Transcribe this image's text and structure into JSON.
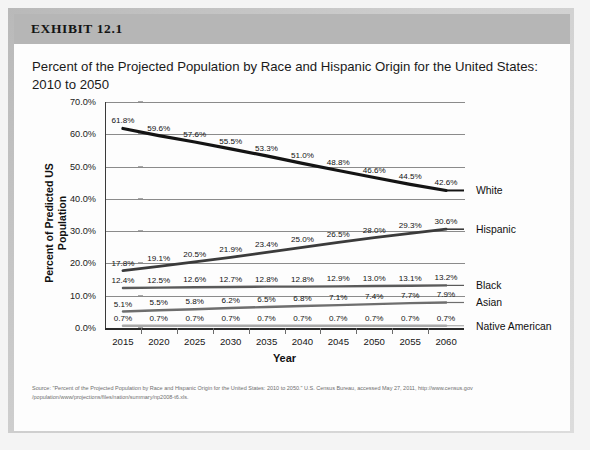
{
  "exhibit": {
    "label": "EXHIBIT 12.1",
    "title": "Percent of the Projected Population by Race and Hispanic Origin for the United States: 2010 to 2050",
    "source": "Source: \"Percent of the Projected Population by Race and Hispanic Origin for the United States:  2010 to 2050.\" U.S. Census Bureau, accessed May 27, 2011, http://www.census.gov /population/www/projections/files/nation/summary/np2008-t6.xls."
  },
  "chart_data": {
    "type": "line",
    "title": "Percent of the Projected Population by Race and Hispanic Origin for the United States: 2010 to 2050",
    "xlabel": "Year",
    "ylabel": "Percent of Predicted US Population",
    "categories": [
      "2015",
      "2020",
      "2025",
      "2030",
      "2035",
      "2040",
      "2045",
      "2050",
      "2055",
      "2060"
    ],
    "ylim": [
      0,
      70
    ],
    "ytick_labels": [
      "0.0%",
      "10.0%",
      "20.0%",
      "30.0%",
      "40.0%",
      "50.0%",
      "60.0%",
      "70.0%"
    ],
    "ytick_values": [
      0,
      10,
      20,
      30,
      40,
      50,
      60,
      70
    ],
    "grid": true,
    "legend_position": "right",
    "series": [
      {
        "name": "White",
        "color": "#141414",
        "width": 3.2,
        "values": [
          61.8,
          59.6,
          57.6,
          55.5,
          53.3,
          51.0,
          48.8,
          46.6,
          44.5,
          42.6
        ],
        "labels": [
          "61.8%",
          "59.6%",
          "57.6%",
          "55.5%",
          "53.3%",
          "51.0%",
          "48.8%",
          "46.6%",
          "44.5%",
          "42.6%"
        ]
      },
      {
        "name": "Hispanic",
        "color": "#3b3b3b",
        "width": 2.8,
        "values": [
          17.8,
          19.1,
          20.5,
          21.9,
          23.4,
          25.0,
          26.5,
          28.0,
          29.3,
          30.6
        ],
        "labels": [
          "17.8%",
          "19.1%",
          "20.5%",
          "21.9%",
          "23.4%",
          "25.0%",
          "26.5%",
          "28.0%",
          "29.3%",
          "30.6%"
        ]
      },
      {
        "name": "Black",
        "color": "#5a5a5a",
        "width": 2.4,
        "values": [
          12.4,
          12.5,
          12.6,
          12.7,
          12.8,
          12.8,
          12.9,
          13.0,
          13.1,
          13.2
        ],
        "labels": [
          "12.4%",
          "12.5%",
          "12.6%",
          "12.7%",
          "12.8%",
          "12.8%",
          "12.9%",
          "13.0%",
          "13.1%",
          "13.2%"
        ]
      },
      {
        "name": "Asian",
        "color": "#6e6e6e",
        "width": 2.4,
        "values": [
          5.1,
          5.5,
          5.8,
          6.2,
          6.5,
          6.8,
          7.1,
          7.4,
          7.7,
          7.9
        ],
        "labels": [
          "5.1%",
          "5.5%",
          "5.8%",
          "6.2%",
          "6.5%",
          "6.8%",
          "7.1%",
          "7.4%",
          "7.7%",
          "7.9%"
        ]
      },
      {
        "name": "Native American",
        "color": "#a8a8a8",
        "width": 2.4,
        "values": [
          0.7,
          0.7,
          0.7,
          0.7,
          0.7,
          0.7,
          0.7,
          0.7,
          0.7,
          0.7
        ],
        "labels": [
          "0.7%",
          "0.7%",
          "0.7%",
          "0.7%",
          "0.7%",
          "0.7%",
          "0.7%",
          "0.7%",
          "0.7%",
          "0.7%"
        ]
      }
    ]
  }
}
